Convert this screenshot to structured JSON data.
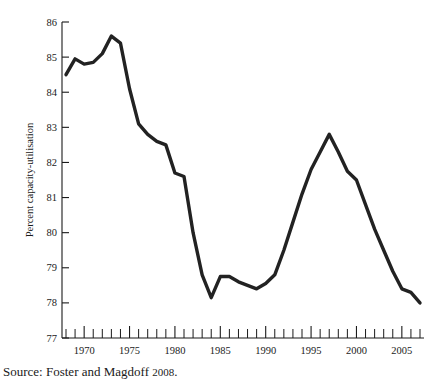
{
  "source_note": {
    "prefix": "Source: Foster and Magdoff ",
    "year": "2008",
    "suffix": "."
  },
  "chart_data": {
    "type": "line",
    "title": "",
    "subtitle": "",
    "xlabel": "",
    "ylabel": "Percent capacity-utilisation",
    "xlim": [
      1968,
      2007
    ],
    "ylim": [
      77,
      86
    ],
    "grid": false,
    "legend": false,
    "legend_position": "none",
    "line_color": "#222222",
    "axis_color": "#1a1a1a",
    "background_color": "#ffffff",
    "y_ticks": [
      77,
      78,
      79,
      80,
      81,
      82,
      83,
      84,
      85,
      86
    ],
    "y_tick_labels": [
      "77",
      "78",
      "79",
      "80",
      "81",
      "82",
      "83",
      "84",
      "85",
      "86"
    ],
    "x_ticks": [
      1968,
      1969,
      1970,
      1971,
      1972,
      1973,
      1974,
      1975,
      1976,
      1977,
      1978,
      1979,
      1980,
      1981,
      1982,
      1983,
      1984,
      1985,
      1986,
      1987,
      1988,
      1989,
      1990,
      1991,
      1992,
      1993,
      1994,
      1995,
      1996,
      1997,
      1998,
      1999,
      2000,
      2001,
      2002,
      2003,
      2004,
      2005,
      2006,
      2007
    ],
    "x_tick_labels": [
      "1970",
      "1975",
      "1980",
      "1985",
      "1990",
      "1995",
      "2000",
      "2005"
    ],
    "x_labeled_ticks": [
      1970,
      1975,
      1980,
      1985,
      1990,
      1995,
      2000,
      2005
    ],
    "x": [
      1968,
      1969,
      1970,
      1971,
      1972,
      1973,
      1974,
      1975,
      1976,
      1977,
      1978,
      1979,
      1980,
      1981,
      1982,
      1983,
      1984,
      1985,
      1986,
      1987,
      1988,
      1989,
      1990,
      1991,
      1992,
      1993,
      1994,
      1995,
      1996,
      1997,
      1998,
      1999,
      2000,
      2001,
      2002,
      2003,
      2004,
      2005,
      2006,
      2007
    ],
    "values": [
      84.5,
      84.95,
      84.8,
      84.85,
      85.1,
      85.6,
      85.4,
      84.1,
      83.1,
      82.8,
      82.6,
      82.5,
      81.7,
      81.6,
      80.0,
      78.8,
      78.15,
      78.75,
      78.75,
      78.6,
      78.5,
      78.4,
      78.55,
      78.8,
      79.5,
      80.3,
      81.1,
      81.8,
      82.3,
      82.8,
      82.3,
      81.75,
      81.5,
      80.8,
      80.1,
      79.5,
      78.9,
      78.4,
      78.3,
      78.0
    ],
    "series": [
      {
        "name": "Percent capacity-utilisation",
        "values": [
          84.5,
          84.95,
          84.8,
          84.85,
          85.1,
          85.6,
          85.4,
          84.1,
          83.1,
          82.8,
          82.6,
          82.5,
          81.7,
          81.6,
          80.0,
          78.8,
          78.15,
          78.75,
          78.75,
          78.6,
          78.5,
          78.4,
          78.55,
          78.8,
          79.5,
          80.3,
          81.1,
          81.8,
          82.3,
          82.8,
          82.3,
          81.75,
          81.5,
          80.8,
          80.1,
          79.5,
          78.9,
          78.4,
          78.3,
          78.0
        ]
      }
    ]
  }
}
